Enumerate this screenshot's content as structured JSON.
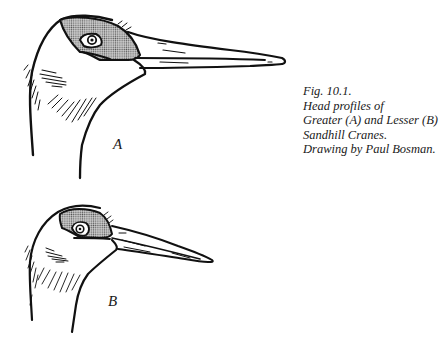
{
  "figure": {
    "caption": {
      "line1": "Fig. 10.1.",
      "line2": "Head profiles of",
      "line3": "Greater (A) and Lesser (B)",
      "line4": "Sandhill Cranes.",
      "line5": "Drawing by Paul Bosman."
    },
    "heads": [
      {
        "label": "A",
        "subject": "Greater Sandhill Crane head profile"
      },
      {
        "label": "B",
        "subject": "Lesser Sandhill Crane head profile"
      }
    ],
    "colors": {
      "ink": "#111111",
      "crown_patch": "#9a9a9a",
      "background": "#ffffff"
    }
  }
}
